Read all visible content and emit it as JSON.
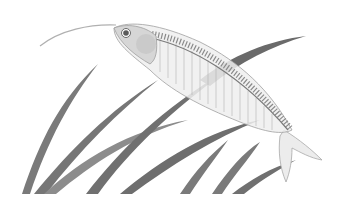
{
  "illustration": {
    "subject": "glass catfish swimming among aquatic plant leaves",
    "style": "grayscale line illustration",
    "colors": {
      "background": "#ffffff",
      "leaf_dark": "#6e6e6e",
      "leaf_light": "#9a9a9a",
      "fish_body": "#e6e6e6",
      "fish_outline": "#9c9c9c",
      "fish_head": "#d2d2d2",
      "eye": "#5a5a5a",
      "spine": "#7a7a7a"
    }
  }
}
